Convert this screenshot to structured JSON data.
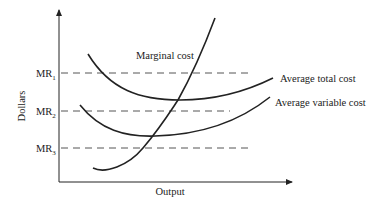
{
  "figure": {
    "y_axis_label": "Dollars",
    "x_axis_label": "Output",
    "price_levels": [
      {
        "name": "MR",
        "sub": "1",
        "y": 73
      },
      {
        "name": "MR",
        "sub": "2",
        "y": 111
      },
      {
        "name": "MR",
        "sub": "3",
        "y": 148
      }
    ],
    "curves": {
      "marginal_cost": {
        "label": "Marginal cost"
      },
      "average_total_cost": {
        "label": "Average total cost"
      },
      "average_variable_cost": {
        "label": "Average variable cost"
      }
    },
    "colors": {
      "line": "#222222",
      "dash": "#555555",
      "text": "#222222"
    }
  }
}
